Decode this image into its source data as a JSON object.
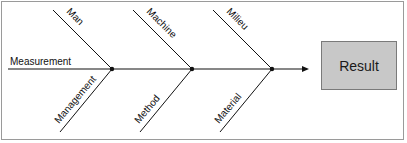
{
  "diagram": {
    "type": "fishbone",
    "result_label": "Result",
    "spine_label": "Measurement",
    "top_causes": [
      "Man",
      "Machine",
      "Milieu"
    ],
    "bottom_causes": [
      "Management",
      "Method",
      "Material"
    ],
    "colors": {
      "line": "#111111",
      "result_fill": "#c8c8c8",
      "result_border": "#7a7a7a",
      "frame_border": "#9a9a9a"
    }
  }
}
